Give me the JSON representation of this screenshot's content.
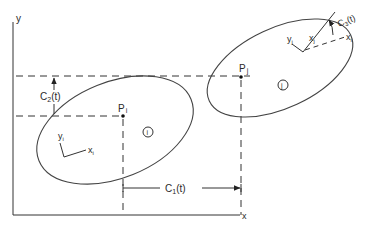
{
  "figure": {
    "axes": {
      "x_label": "x",
      "y_label": "y"
    },
    "bodies": [
      {
        "id": "i",
        "marker": "i",
        "point_label": "P",
        "point_sub": "i",
        "local_x_label": "x",
        "local_x_sub": "i",
        "local_y_label": "y",
        "local_y_sub": "i"
      },
      {
        "id": "j",
        "marker": "j",
        "point_label": "P",
        "point_sub": "j",
        "local_x_label": "x",
        "local_x_sub": "j",
        "local_y_label": "y",
        "local_y_sub": "j",
        "ref_x_label": "x",
        "ref_x_sub": "i"
      }
    ],
    "dimensions": {
      "c1": {
        "base": "C",
        "sub": "1",
        "arg": "(t)"
      },
      "c2": {
        "base": "C",
        "sub": "2",
        "arg": "(t)"
      },
      "c3": {
        "base": "C",
        "sub": "3",
        "arg": "(t)"
      }
    },
    "colors": {
      "stroke": "#333333",
      "background": "#ffffff"
    }
  }
}
